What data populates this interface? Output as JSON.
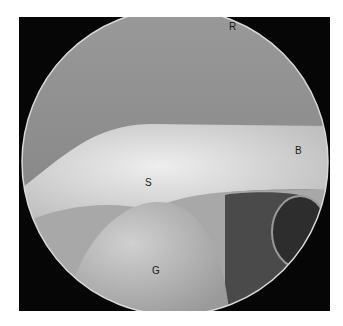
{
  "image": {
    "type": "arthroscopic view",
    "background": "#060606",
    "colors": {
      "upper_tissue": "#8a8a8a",
      "tendon": "#cfcfcf",
      "humeral_head": "#b8b8b8",
      "dark_recess": "#3a3a3a"
    }
  },
  "labels": [
    {
      "id": "R",
      "text": "R",
      "x": 229,
      "y": 24
    },
    {
      "id": "B",
      "text": "B",
      "x": 295,
      "y": 147
    },
    {
      "id": "S",
      "text": "S",
      "x": 145,
      "y": 179
    },
    {
      "id": "G",
      "text": "G",
      "x": 152,
      "y": 267
    }
  ]
}
